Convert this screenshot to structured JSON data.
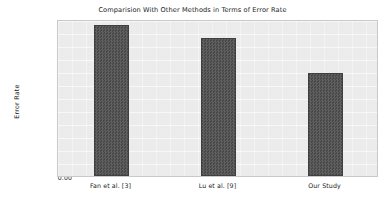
{
  "chart_data": {
    "type": "bar",
    "title": "Comparision With Other Methods in Terms of Error Rate",
    "xlabel": "",
    "ylabel": "Error Rate",
    "categories": [
      "Fan et al. [3]",
      "Lu et al. [9]",
      "Our Study"
    ],
    "values": [
      0.12,
      0.11,
      0.082
    ],
    "ylim": [
      0.0,
      0.125
    ],
    "yticks": [
      "0.00",
      "0.02",
      "0.04",
      "0.06",
      "0.08",
      "0.10",
      "0.12"
    ],
    "ytick_values": [
      0.0,
      0.02,
      0.04,
      0.06,
      0.08,
      0.1,
      0.12
    ],
    "grid": false,
    "legend": "none",
    "bar_color": "#4d4d4d",
    "plot_background": "#f1f1f1",
    "figure_background": "#ffffff"
  }
}
